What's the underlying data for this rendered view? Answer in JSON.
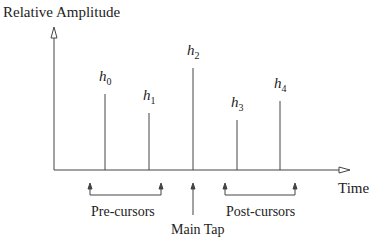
{
  "chart_data": {
    "type": "stem",
    "title": "",
    "ylabel": "Relative Amplitude",
    "xlabel": "Time",
    "taps": [
      {
        "label": "h",
        "index": "0",
        "x": 105,
        "height": 76
      },
      {
        "label": "h",
        "index": "1",
        "x": 149,
        "height": 57
      },
      {
        "label": "h",
        "index": "2",
        "x": 193,
        "height": 102
      },
      {
        "label": "h",
        "index": "3",
        "x": 237,
        "height": 50
      },
      {
        "label": "h",
        "index": "4",
        "x": 280,
        "height": 69
      }
    ],
    "annotations": {
      "pre": "Pre-cursors",
      "main": "Main Tap",
      "post": "Post-cursors"
    },
    "grid": false
  }
}
